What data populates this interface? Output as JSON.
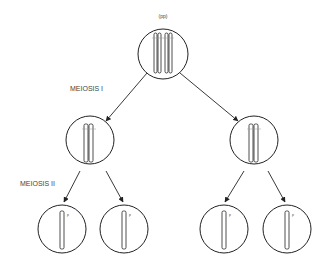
{
  "diagram": {
    "title": "Meiosis",
    "genotype_label": "(pp)",
    "stages": [
      {
        "label": "MEIOSIS I"
      },
      {
        "label": "MEIOSIS II"
      }
    ],
    "allele_label": "p",
    "cells": {
      "parent": {
        "genotype": "(pp)",
        "chromosomes": "2 pairs of sister chromatids (homologous pair)"
      },
      "meiosis1_products": [
        {
          "position": "left",
          "chromosomes": "1 replicated chromosome"
        },
        {
          "position": "right",
          "chromosomes": "1 replicated chromosome"
        }
      ],
      "meiosis2_products": [
        {
          "position": "left-1",
          "allele": "p"
        },
        {
          "position": "left-2",
          "allele": "p"
        },
        {
          "position": "right-1",
          "allele": "p"
        },
        {
          "position": "right-2",
          "allele": "p"
        }
      ]
    },
    "colors": {
      "stroke": "#222222",
      "label": "#444444",
      "background": "#ffffff"
    }
  }
}
